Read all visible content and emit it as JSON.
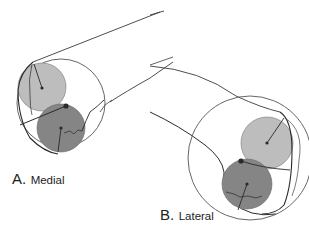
{
  "figure": {
    "panels": [
      {
        "id": "A",
        "letter": "A.",
        "caption": "Medial",
        "outline_circle": {
          "cx": 61,
          "cy": 103,
          "r": 44
        },
        "light_circle": {
          "cx": 42,
          "cy": 87,
          "r": 24
        },
        "dark_circle": {
          "cx": 61,
          "cy": 128,
          "r": 24
        },
        "contact_dot": {
          "cx": 66,
          "cy": 106
        }
      },
      {
        "id": "B",
        "letter": "B.",
        "caption": "Lateral",
        "outline_circle": {
          "cx": 250,
          "cy": 158,
          "r": 62
        },
        "light_circle": {
          "cx": 267,
          "cy": 143,
          "r": 26
        },
        "dark_circle": {
          "cx": 247,
          "cy": 184,
          "r": 25
        },
        "contact_dot": {
          "cx": 241,
          "cy": 161
        }
      }
    ],
    "colors": {
      "light_fill": "#bdbdbd",
      "dark_fill": "#858585",
      "stroke": "#2a2a2a",
      "outline": "#555555"
    }
  }
}
